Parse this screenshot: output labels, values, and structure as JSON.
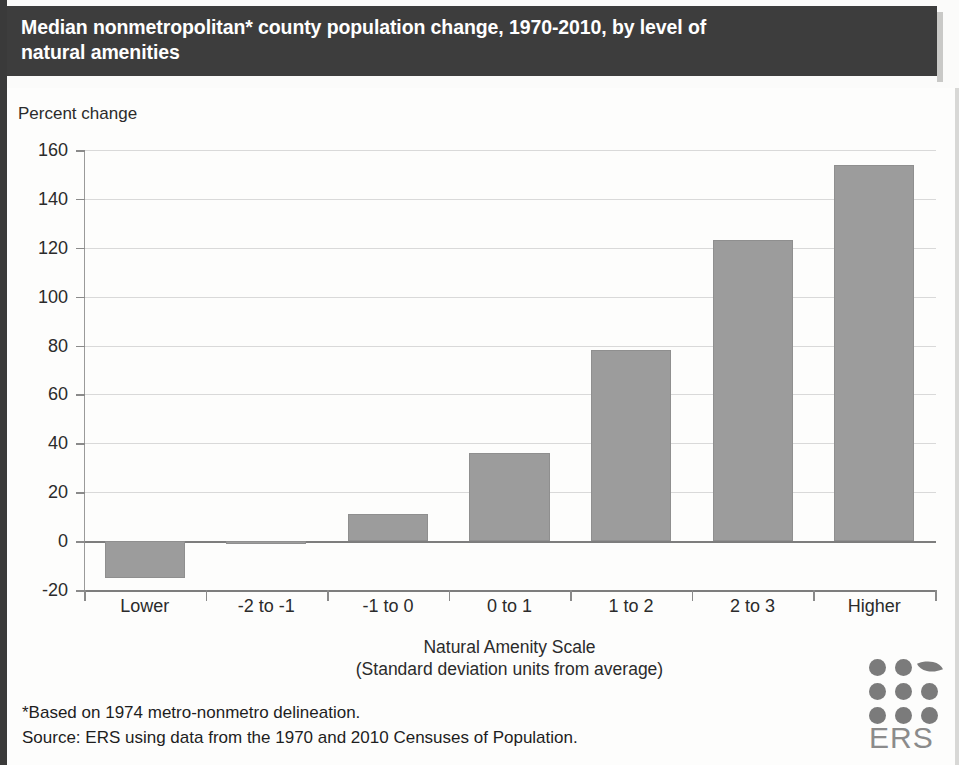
{
  "title": {
    "line1": "Median nonmetropolitan* county population change, 1970-2010, by level of",
    "line2": "natural amenities"
  },
  "axes": {
    "y_axis_title": "Percent change",
    "x_axis_title_line1": "Natural Amenity Scale",
    "x_axis_title_line2": "(Standard deviation units from average)"
  },
  "footnotes": {
    "line1": "*Based on 1974 metro-nonmetro delineation.",
    "line2": "Source:  ERS using data from the 1970 and 2010 Censuses of Population."
  },
  "logo": {
    "text": "ERS"
  },
  "colors": {
    "banner_background": "#3d3d3d",
    "banner_text": "#ffffff",
    "bar_fill": "#9c9c9c",
    "gridline": "#d9d9d9",
    "axis": "#7d7d7d"
  },
  "chart_data": {
    "type": "bar",
    "title": "Median nonmetropolitan* county population change, 1970-2010, by level of natural amenities",
    "xlabel": "Natural Amenity Scale (Standard deviation units from average)",
    "ylabel": "Percent change",
    "categories": [
      "Lower",
      "-2 to -1",
      "-1 to 0",
      "0 to 1",
      "1 to 2",
      "2 to 3",
      "Higher"
    ],
    "values": [
      -15,
      -1,
      11,
      36,
      78,
      123,
      154
    ],
    "ylim": [
      -20,
      160
    ],
    "ytick_labels": [
      "160",
      "140",
      "120",
      "100",
      "80",
      "60",
      "40",
      "20",
      "0",
      "-20"
    ],
    "ytick_values": [
      160,
      140,
      120,
      100,
      80,
      60,
      40,
      20,
      0,
      -20
    ],
    "grid": true,
    "legend": "none"
  }
}
